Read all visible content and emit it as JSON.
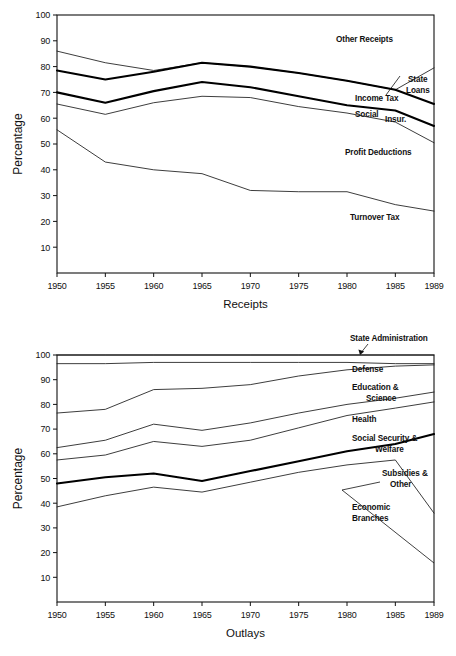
{
  "page": {
    "background_color": "#ffffff",
    "ink_color": "#111111"
  },
  "charts": {
    "receipts": {
      "axis": {
        "ylabel": "Percentage",
        "xlabel": "Receipts",
        "ytick_labels": [
          "100",
          "90",
          "80",
          "70",
          "60",
          "50",
          "40",
          "30",
          "20",
          "10"
        ],
        "xtick_labels": [
          "1950",
          "1955",
          "1960",
          "1965",
          "1970",
          "1975",
          "1980",
          "1985",
          "1989"
        ]
      },
      "labels": {
        "other_receipts": "Other Receipts",
        "state_loans_line1": "State",
        "state_loans_line2": "Loans",
        "income_tax": "Income Tax",
        "social_a": "Social",
        "social_b": "Insur.",
        "profit_deductions": "Profit Deductions",
        "turnover_tax": "Turnover Tax"
      }
    },
    "outlays": {
      "axis": {
        "ylabel": "Percentage",
        "xlabel": "Outlays",
        "ytick_labels": [
          "100",
          "90",
          "80",
          "70",
          "60",
          "50",
          "40",
          "30",
          "20",
          "10"
        ],
        "xtick_labels": [
          "1950",
          "1955",
          "1960",
          "1965",
          "1970",
          "1975",
          "1980",
          "1985",
          "1989"
        ]
      },
      "labels": {
        "state_administration": "State Administration",
        "defense": "Defense",
        "education_line1": "Education &",
        "education_line2": "Science",
        "health": "Health",
        "social_security_line1": "Social Security &",
        "social_security_line2": "Welfare",
        "subsidies_line1": "Subsidies &",
        "subsidies_line2": "Other",
        "economic_line1": "Economic",
        "economic_line2": "Branches"
      }
    }
  },
  "chart_data": [
    {
      "type": "line",
      "id": "receipts",
      "title": "",
      "xlabel": "Receipts",
      "ylabel": "Percentage",
      "xlim": [
        1950,
        1989
      ],
      "ylim": [
        0,
        100
      ],
      "grid": false,
      "legend": "inline-annotations",
      "x": [
        1950,
        1955,
        1960,
        1965,
        1970,
        1975,
        1980,
        1985,
        1989
      ],
      "xticks": [
        1950,
        1955,
        1960,
        1965,
        1970,
        1975,
        1980,
        1985,
        1989
      ],
      "yticks": [
        10,
        20,
        30,
        40,
        50,
        60,
        70,
        80,
        90,
        100
      ],
      "series": [
        {
          "name": "State Loans boundary",
          "weight": "thin",
          "annotation": "State Loans",
          "values": [
            86.0,
            81.5,
            78.5,
            81.5,
            80.0,
            77.5,
            74.5,
            71.0,
            79.5
          ]
        },
        {
          "name": "Other Receipts boundary",
          "weight": "bold",
          "annotation": "Other Receipts",
          "values": [
            78.5,
            75.0,
            78.0,
            81.5,
            80.0,
            77.5,
            74.5,
            71.0,
            65.5
          ]
        },
        {
          "name": "Income Tax boundary",
          "weight": "bold",
          "annotation": "Income Tax",
          "values": [
            70.0,
            66.0,
            70.5,
            74.0,
            72.0,
            68.5,
            65.0,
            63.0,
            57.0
          ]
        },
        {
          "name": "Social Insurance boundary",
          "weight": "thin",
          "annotation": "Social Insur.",
          "values": [
            65.5,
            61.5,
            66.0,
            68.5,
            68.0,
            64.5,
            62.0,
            58.5,
            50.5
          ]
        },
        {
          "name": "Profit Deductions boundary",
          "weight": "thin",
          "annotation": "Profit Deductions",
          "values": [
            55.5,
            43.0,
            40.0,
            38.5,
            32.0,
            31.5,
            31.5,
            26.5,
            24.0
          ]
        }
      ],
      "annotation_only": [
        "Turnover Tax"
      ]
    },
    {
      "type": "line",
      "id": "outlays",
      "title": "",
      "xlabel": "Outlays",
      "ylabel": "Percentage",
      "xlim": [
        1950,
        1989
      ],
      "ylim": [
        0,
        100
      ],
      "grid": false,
      "legend": "inline-annotations",
      "x": [
        1950,
        1955,
        1960,
        1965,
        1970,
        1975,
        1980,
        1985,
        1989
      ],
      "xticks": [
        1950,
        1955,
        1960,
        1965,
        1970,
        1975,
        1980,
        1985,
        1989
      ],
      "yticks": [
        10,
        20,
        30,
        40,
        50,
        60,
        70,
        80,
        90,
        100
      ],
      "series": [
        {
          "name": "State Administration boundary",
          "weight": "thin",
          "annotation": "State Administration",
          "values": [
            100.0,
            100.0,
            100.0,
            100.0,
            100.0,
            100.0,
            100.0,
            100.0,
            100.0
          ]
        },
        {
          "name": "Defense boundary",
          "weight": "thin",
          "annotation": "Defense",
          "values": [
            96.5,
            96.5,
            97.0,
            97.0,
            97.0,
            97.0,
            97.0,
            96.5,
            96.5
          ]
        },
        {
          "name": "Education & Science boundary",
          "weight": "thin",
          "annotation": "Education & Science",
          "values": [
            76.5,
            78.0,
            86.0,
            86.5,
            88.0,
            91.5,
            94.0,
            95.5,
            96.0
          ]
        },
        {
          "name": "Health boundary",
          "weight": "thin",
          "annotation": "Health",
          "values": [
            62.5,
            65.5,
            72.0,
            69.5,
            72.5,
            76.5,
            80.0,
            82.5,
            85.0
          ]
        },
        {
          "name": "Social Security & Welfare boundary",
          "weight": "thin",
          "annotation": "Social Security & Welfare",
          "values": [
            57.5,
            59.5,
            65.0,
            63.0,
            65.5,
            70.5,
            75.5,
            78.5,
            81.0
          ]
        },
        {
          "name": "Subsidies & Other boundary",
          "weight": "bold",
          "annotation": "Subsidies & Other",
          "values": [
            48.0,
            50.5,
            52.0,
            49.0,
            53.0,
            57.0,
            61.0,
            64.0,
            68.0
          ]
        },
        {
          "name": "Economic Branches boundary",
          "weight": "thin",
          "annotation": "Economic Branches",
          "values": [
            38.5,
            43.0,
            46.5,
            44.5,
            48.5,
            52.5,
            55.5,
            57.5,
            36.0
          ]
        }
      ]
    }
  ]
}
